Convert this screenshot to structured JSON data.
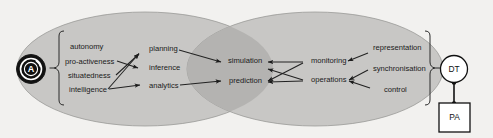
{
  "figure": {
    "background_color": "#f2f1ef",
    "ellipse_color": "#c8c7c5",
    "overlap_color": "#b4b3b1",
    "line_color": "#222222"
  },
  "agent_badge": {
    "name": "agent-icon",
    "letter": "A"
  },
  "left_group": {
    "bracket": "left-curly-brace",
    "attributes": [
      {
        "id": "autonomy",
        "label": "autonomy"
      },
      {
        "id": "pro-activeness",
        "label": "pro-activeness"
      },
      {
        "id": "situatedness",
        "label": "situatedness"
      },
      {
        "id": "intelligence",
        "label": "intelligence"
      }
    ]
  },
  "left_capabilities": [
    {
      "id": "planning",
      "label": "planning"
    },
    {
      "id": "inference",
      "label": "inference"
    },
    {
      "id": "analytics",
      "label": "analytics"
    }
  ],
  "shared_capabilities": [
    {
      "id": "simulation",
      "label": "simulation"
    },
    {
      "id": "prediction",
      "label": "prediction"
    }
  ],
  "right_capabilities": [
    {
      "id": "monitoring",
      "label": "monitoring"
    },
    {
      "id": "operations",
      "label": "operations"
    }
  ],
  "right_group": {
    "bracket": "right-curly-brace",
    "attributes": [
      {
        "id": "representation",
        "label": "representation"
      },
      {
        "id": "synchronisation",
        "label": "synchronisation"
      },
      {
        "id": "control",
        "label": "control"
      }
    ]
  },
  "dt_badge": {
    "name": "digital-twin-badge",
    "label": "DT"
  },
  "pa_badge": {
    "name": "physical-asset-badge",
    "label": "PA"
  }
}
